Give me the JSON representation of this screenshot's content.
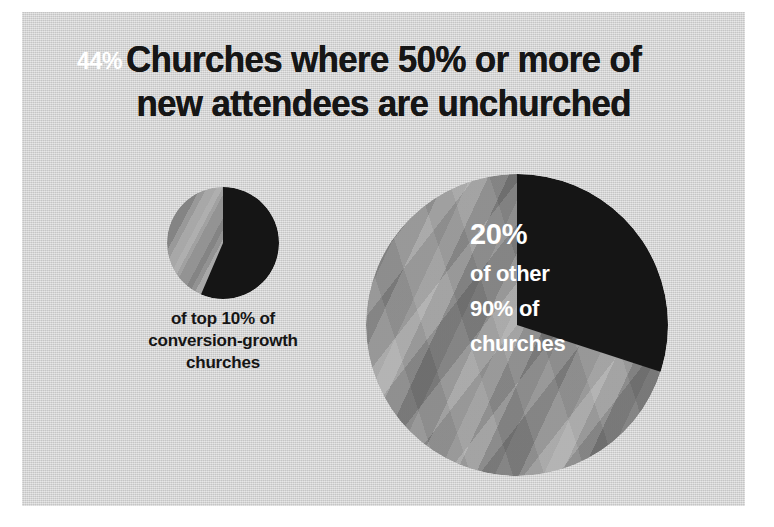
{
  "chart_data": {
    "type": "pie",
    "title": "Churches where 50% or more of new attendees are unchurched",
    "title_lines": [
      "Churches where 50% or more of",
      "new attendees are unchurched"
    ],
    "xlabel": "",
    "ylabel": "",
    "legend_position": "none",
    "grid": false,
    "background_color": "#d2d2d2",
    "charts": [
      {
        "name": "top-10-percent-conversion-growth-churches",
        "size": "small",
        "categories": [
          "50% or more of new attendees are unchurched",
          "Other"
        ],
        "values": [
          44,
          56
        ],
        "colors": [
          "#151515",
          "#9b9b9b"
        ],
        "highlight_label": "44%",
        "caption_lines": [
          "of top 10% of",
          "conversion-growth",
          "churches"
        ]
      },
      {
        "name": "other-90-percent-of-churches",
        "size": "large",
        "categories": [
          "50% or more of new attendees are unchurched",
          "Other"
        ],
        "values": [
          20,
          80
        ],
        "colors": [
          "#151515",
          "#8e8e8e"
        ],
        "highlight_label": "20%",
        "label_lines": [
          "20%",
          "of other",
          "90% of",
          "churches"
        ]
      }
    ]
  },
  "slide": {
    "title": {
      "line1": "Churches where 50% or more of",
      "line2": "new attendees are unchurched"
    },
    "small_pie": {
      "value_label": "44%",
      "caption": {
        "line1": "of top 10% of",
        "line2": "conversion-growth",
        "line3": "churches"
      }
    },
    "large_pie": {
      "value_label": "20%",
      "desc_line1": "of other",
      "desc_line2": "90% of",
      "desc_line3": "churches"
    }
  }
}
